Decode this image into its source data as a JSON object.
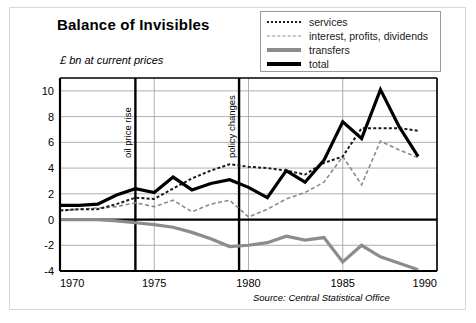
{
  "figure": {
    "title": "Balance of Invisibles",
    "subtitle": "£ bn at current prices",
    "source": "Source: Central Statistical Office"
  },
  "legend": {
    "items": [
      {
        "label": "services",
        "style": "dotted-black",
        "color": "#1a1a1a"
      },
      {
        "label": "interest, profits, dividends",
        "style": "dashed-gray",
        "color": "#8a8a8a"
      },
      {
        "label": "transfers",
        "style": "solid-gray",
        "color": "#8c8c8c"
      },
      {
        "label": "total",
        "style": "solid-black",
        "color": "#000000"
      }
    ]
  },
  "axes": {
    "y_ticks": [
      "10",
      "8",
      "6",
      "4",
      "2",
      "0",
      "-2",
      "-4"
    ],
    "x_ticks": [
      "1970",
      "1975",
      "1980",
      "1985",
      "1990"
    ]
  },
  "annotations": [
    {
      "label": "oil price rise",
      "year": 1974
    },
    {
      "label": "policy changes",
      "year": 1979.5
    }
  ],
  "chart_data": {
    "type": "line",
    "title": "Balance of Invisibles",
    "subtitle": "£ bn at current prices",
    "xlabel": "",
    "ylabel": "£ bn at current prices",
    "xlim": [
      1970,
      1990
    ],
    "ylim": [
      -4,
      11
    ],
    "y_ticks": [
      -4,
      -2,
      0,
      2,
      4,
      6,
      8,
      10
    ],
    "x_ticks": [
      1970,
      1975,
      1980,
      1985,
      1990
    ],
    "grid": "horizontal-and-vertical",
    "legend_position": "top-right",
    "source": "Source: Central Statistical Office",
    "annotations": [
      {
        "label": "oil price rise",
        "x": 1974,
        "type": "vline"
      },
      {
        "label": "policy changes",
        "x": 1979.5,
        "type": "vline"
      }
    ],
    "x": [
      1970,
      1971,
      1972,
      1973,
      1974,
      1975,
      1976,
      1977,
      1978,
      1979,
      1980,
      1981,
      1982,
      1983,
      1984,
      1985,
      1986,
      1987,
      1988,
      1989
    ],
    "series": [
      {
        "name": "total",
        "style": "solid-black",
        "color": "#000000",
        "values": [
          1.1,
          1.1,
          1.2,
          1.9,
          2.4,
          2.1,
          3.3,
          2.3,
          2.8,
          3.1,
          2.5,
          1.7,
          3.8,
          2.9,
          4.6,
          7.6,
          6.3,
          10.1,
          7.2,
          4.9
        ]
      },
      {
        "name": "services",
        "style": "dotted-black",
        "color": "#1a1a1a",
        "values": [
          0.7,
          0.8,
          0.8,
          1.2,
          1.7,
          1.6,
          2.4,
          3.2,
          3.8,
          4.3,
          4.1,
          4.0,
          3.8,
          3.5,
          4.4,
          4.9,
          7.1,
          7.1,
          7.1,
          6.9
        ]
      },
      {
        "name": "interest, profits, dividends",
        "style": "dashed-gray",
        "color": "#8a8a8a",
        "values": [
          0.7,
          0.8,
          0.9,
          1.0,
          1.3,
          1.0,
          1.5,
          0.6,
          1.2,
          1.5,
          0.2,
          0.8,
          1.6,
          2.1,
          2.9,
          4.9,
          2.7,
          6.1,
          5.4,
          4.8
        ]
      },
      {
        "name": "transfers",
        "style": "solid-gray",
        "color": "#8c8c8c",
        "values": [
          0.0,
          0.0,
          0.0,
          -0.1,
          -0.25,
          -0.4,
          -0.6,
          -1.0,
          -1.5,
          -2.1,
          -2.0,
          -1.8,
          -1.3,
          -1.6,
          -1.4,
          -3.3,
          -2.0,
          -2.9,
          -3.4,
          -3.9
        ]
      }
    ]
  },
  "plot_geometry": {
    "left": 60,
    "right": 437,
    "top": 78,
    "bottom": 271,
    "x_min": 1970,
    "x_max": 1990,
    "y_min": -4,
    "y_max": 11
  }
}
